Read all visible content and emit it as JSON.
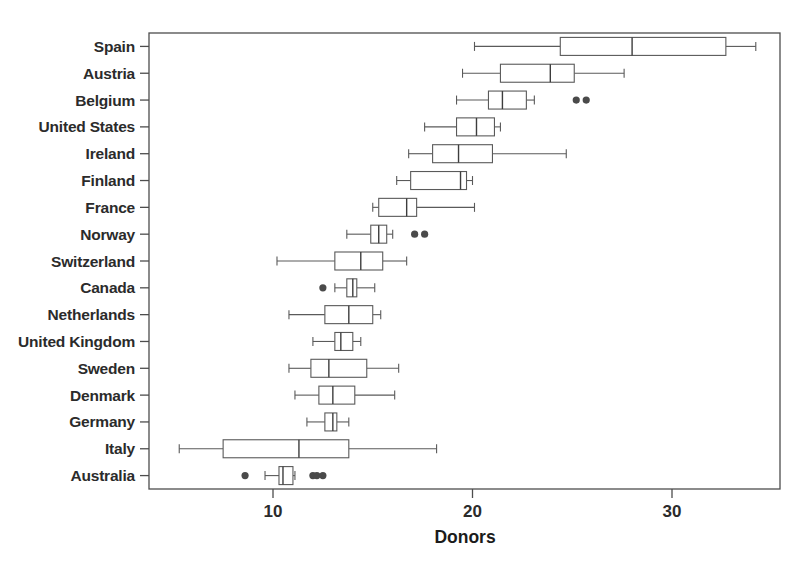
{
  "chart_data": {
    "type": "box",
    "title": "",
    "xlabel": "Donors",
    "ylabel": "",
    "xlim": [
      4.55,
      35.55
    ],
    "xticks": [
      10,
      20,
      30
    ],
    "xtick_labels": [
      "10",
      "20",
      "30"
    ],
    "grid": false,
    "legend": null,
    "orientation": "horizontal",
    "categories": [
      "Spain",
      "Austria",
      "Belgium",
      "United States",
      "Ireland",
      "Finland",
      "France",
      "Norway",
      "Switzerland",
      "Canada",
      "Netherlands",
      "United Kingdom",
      "Sweden",
      "Denmark",
      "Germany",
      "Italy",
      "Australia"
    ],
    "boxes": [
      {
        "category": "Spain",
        "whisker_low": 20.1,
        "q1": 24.4,
        "median": 28.0,
        "q3": 32.7,
        "whisker_high": 34.2,
        "outliers": []
      },
      {
        "category": "Austria",
        "whisker_low": 19.5,
        "q1": 21.4,
        "median": 23.9,
        "q3": 25.1,
        "whisker_high": 27.6,
        "outliers": []
      },
      {
        "category": "Belgium",
        "whisker_low": 19.2,
        "q1": 20.8,
        "median": 21.5,
        "q3": 22.7,
        "whisker_high": 23.1,
        "outliers": [
          25.2,
          25.7
        ]
      },
      {
        "category": "United States",
        "whisker_low": 17.6,
        "q1": 19.2,
        "median": 20.2,
        "q3": 21.1,
        "whisker_high": 21.4,
        "outliers": []
      },
      {
        "category": "Ireland",
        "whisker_low": 16.8,
        "q1": 18.0,
        "median": 19.3,
        "q3": 21.0,
        "whisker_high": 24.7,
        "outliers": []
      },
      {
        "category": "Finland",
        "whisker_low": 16.2,
        "q1": 16.9,
        "median": 19.4,
        "q3": 19.7,
        "whisker_high": 20.0,
        "outliers": []
      },
      {
        "category": "France",
        "whisker_low": 15.0,
        "q1": 15.3,
        "median": 16.7,
        "q3": 17.2,
        "whisker_high": 20.1,
        "outliers": []
      },
      {
        "category": "Norway",
        "whisker_low": 13.7,
        "q1": 14.9,
        "median": 15.3,
        "q3": 15.7,
        "whisker_high": 16.0,
        "outliers": [
          17.1,
          17.6
        ]
      },
      {
        "category": "Switzerland",
        "whisker_low": 10.2,
        "q1": 13.1,
        "median": 14.4,
        "q3": 15.5,
        "whisker_high": 16.7,
        "outliers": []
      },
      {
        "category": "Canada",
        "whisker_low": 13.1,
        "q1": 13.7,
        "median": 14.0,
        "q3": 14.2,
        "whisker_high": 15.1,
        "outliers": [
          12.5
        ]
      },
      {
        "category": "Netherlands",
        "whisker_low": 10.8,
        "q1": 12.6,
        "median": 13.8,
        "q3": 15.0,
        "whisker_high": 15.4,
        "outliers": []
      },
      {
        "category": "United Kingdom",
        "whisker_low": 12.0,
        "q1": 13.1,
        "median": 13.4,
        "q3": 14.0,
        "whisker_high": 14.4,
        "outliers": []
      },
      {
        "category": "Sweden",
        "whisker_low": 10.8,
        "q1": 11.9,
        "median": 12.8,
        "q3": 14.7,
        "whisker_high": 16.3,
        "outliers": []
      },
      {
        "category": "Denmark",
        "whisker_low": 11.1,
        "q1": 12.3,
        "median": 13.0,
        "q3": 14.1,
        "whisker_high": 16.1,
        "outliers": []
      },
      {
        "category": "Germany",
        "whisker_low": 11.7,
        "q1": 12.6,
        "median": 13.0,
        "q3": 13.2,
        "whisker_high": 13.8,
        "outliers": []
      },
      {
        "category": "Italy",
        "whisker_low": 5.3,
        "q1": 7.5,
        "median": 11.3,
        "q3": 13.8,
        "whisker_high": 18.2,
        "outliers": []
      },
      {
        "category": "Australia",
        "whisker_low": 9.6,
        "q1": 10.3,
        "median": 10.5,
        "q3": 11.0,
        "whisker_high": 11.1,
        "outliers": [
          8.6,
          12.0,
          12.2,
          12.5
        ]
      }
    ]
  },
  "colors": {
    "frame": "#4d4d4d",
    "box_stroke": "#5a5a5a",
    "box_fill": "#ffffff",
    "median": "#3d3d3d",
    "outlier": "#4a4a4a",
    "text": "#2b2b2b",
    "background": "#ffffff"
  }
}
